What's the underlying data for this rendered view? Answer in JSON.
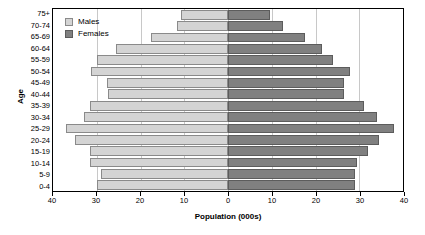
{
  "chart": {
    "type": "bar",
    "title": "",
    "xlabel": "Population (000s)",
    "ylabel": "Age"
  },
  "legend": {
    "position": "top-left",
    "items": [
      {
        "label": "Males",
        "color": "#d4d4d4"
      },
      {
        "label": "Females",
        "color": "#808080"
      }
    ]
  },
  "axis": {
    "x_tick_labels": [
      "40",
      "30",
      "20",
      "10",
      "0",
      "10",
      "20",
      "30",
      "40"
    ],
    "x_tick_values": [
      -40,
      -30,
      -20,
      -10,
      0,
      10,
      20,
      30,
      40
    ],
    "x_min": -40,
    "x_max": 40,
    "grid": true
  },
  "chart_data": {
    "type": "bar",
    "subtype": "population-pyramid",
    "title": "",
    "xlabel": "Population (000s)",
    "ylabel": "Age",
    "xlim": [
      -40,
      40
    ],
    "xticks": [
      -40,
      -30,
      -20,
      -10,
      0,
      10,
      20,
      30,
      40
    ],
    "xticklabels": [
      "40",
      "30",
      "20",
      "10",
      "0",
      "10",
      "20",
      "30",
      "40"
    ],
    "grid": true,
    "legend_position": "top-left",
    "orientation": "horizontal",
    "categories": [
      "75+",
      "70-74",
      "65-69",
      "60-64",
      "55-59",
      "50-54",
      "45-49",
      "40-44",
      "35-39",
      "30-34",
      "25-29",
      "20-24",
      "15-19",
      "10-14",
      "5-9",
      "0-4"
    ],
    "series": [
      {
        "name": "Males",
        "color": "#d4d4d4",
        "side": "left",
        "values": [
          10.7,
          11.6,
          17.5,
          25.5,
          30.0,
          31.4,
          27.7,
          27.5,
          31.6,
          33.0,
          37.0,
          35.0,
          31.5,
          31.6,
          29.0,
          30.0
        ]
      },
      {
        "name": "Females",
        "color": "#808080",
        "side": "right",
        "values": [
          9.5,
          12.5,
          17.5,
          21.5,
          24.0,
          27.8,
          26.5,
          26.5,
          31.0,
          34.0,
          38.0,
          34.5,
          32.0,
          29.5,
          29.0,
          29.0
        ]
      }
    ]
  }
}
